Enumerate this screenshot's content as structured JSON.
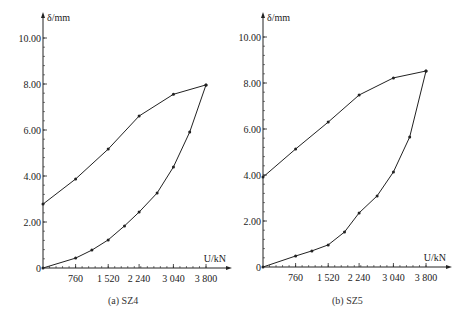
{
  "chart_data": [
    {
      "type": "line",
      "title": "SZ4",
      "caption": "(a) SZ4",
      "xlabel": "U/kN",
      "ylabel": "δ/mm",
      "xlim": [
        0,
        3800
      ],
      "ylim": [
        0,
        10
      ],
      "x_ticks": [
        760,
        1520,
        2240,
        3040,
        3800
      ],
      "x_tick_labels": [
        "760",
        "1 520",
        "2 240",
        "3 040",
        "3 800"
      ],
      "y_ticks": [
        0,
        2,
        4,
        6,
        8,
        10
      ],
      "y_tick_labels": [
        "0",
        "2.00",
        "4.00",
        "6.00",
        "8.00",
        "10.00"
      ],
      "grid": false,
      "series": [
        {
          "name": "loading",
          "x": [
            0,
            760,
            1140,
            1520,
            1900,
            2240,
            2660,
            3040,
            3420,
            3800
          ],
          "values": [
            0,
            0.43,
            0.78,
            1.22,
            1.83,
            2.43,
            3.26,
            4.39,
            5.91,
            7.96
          ]
        },
        {
          "name": "unloading",
          "x": [
            3800,
            3040,
            2240,
            1520,
            760,
            0
          ],
          "values": [
            7.96,
            7.55,
            6.61,
            5.17,
            3.87,
            2.78
          ]
        }
      ]
    },
    {
      "type": "line",
      "title": "SZ5",
      "caption": "(b) SZ5",
      "xlabel": "U/kN",
      "ylabel": "δ/mm",
      "xlim": [
        0,
        3800
      ],
      "ylim": [
        0,
        10
      ],
      "x_ticks": [
        760,
        1520,
        2240,
        3040,
        3800
      ],
      "x_tick_labels": [
        "760",
        "1 520",
        "2 240",
        "3 040",
        "3 800"
      ],
      "y_ticks": [
        0,
        2,
        4,
        6,
        8,
        10
      ],
      "y_tick_labels": [
        "0",
        "2.00",
        "4.00",
        "6.00",
        "8.00",
        "10.00"
      ],
      "grid": false,
      "series": [
        {
          "name": "loading",
          "x": [
            0,
            760,
            1140,
            1520,
            1900,
            2240,
            2660,
            3040,
            3420,
            3800
          ],
          "values": [
            0,
            0.48,
            0.7,
            0.96,
            1.52,
            2.35,
            3.09,
            4.13,
            5.65,
            8.52
          ]
        },
        {
          "name": "unloading",
          "x": [
            3800,
            3040,
            2240,
            1520,
            760,
            0
          ],
          "values": [
            8.52,
            8.22,
            7.48,
            6.3,
            5.13,
            3.91
          ]
        }
      ]
    }
  ],
  "layout": {
    "panels": [
      {
        "ox": 43,
        "oy": 268,
        "px_per_kN": 0.0429,
        "px_per_mm": 23.0,
        "axis_end_x": 228,
        "axis_top_y": 16
      },
      {
        "ox": 263,
        "oy": 267,
        "px_per_kN": 0.0429,
        "px_per_mm": 23.0,
        "axis_end_x": 448,
        "axis_top_y": 16
      }
    ],
    "line_color": "#222222"
  }
}
